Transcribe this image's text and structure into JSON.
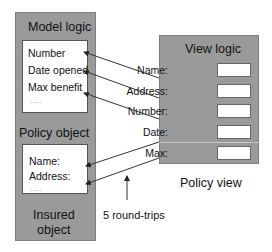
{
  "model_panel": {
    "title": "Model logic",
    "fields": [
      "Number",
      "Date opened",
      "Max benefit",
      "....."
    ]
  },
  "policy_panel": {
    "title": "Policy object",
    "fields": [
      "Name:",
      "Address:",
      "....."
    ],
    "caption_line1": "Insured",
    "caption_line2": "object"
  },
  "view_panel": {
    "title": "View logic",
    "fields": [
      "Name:",
      "Address:",
      "Number:",
      "Date:",
      "Max:"
    ],
    "caption": "Policy view"
  },
  "annotation": "5 round-trips",
  "colors": {
    "panel": "#9a9a9a",
    "box": "#ffffff",
    "line": "#333333"
  }
}
